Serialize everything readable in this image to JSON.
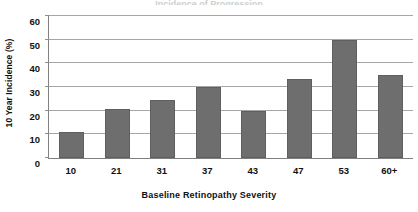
{
  "chart_data": {
    "type": "bar",
    "title": "",
    "xlabel": "Baseline Retinopathy Severity",
    "ylabel": "10 Year Incidence (%)",
    "categories": [
      "10",
      "21",
      "31",
      "37",
      "43",
      "47",
      "53",
      "60+"
    ],
    "values": [
      11,
      20.5,
      24.5,
      30,
      20,
      33.5,
      50,
      35
    ],
    "series": [
      {
        "name": "10 Year Incidence (%)",
        "values": [
          11,
          20.5,
          24.5,
          30,
          20,
          33.5,
          50,
          35
        ]
      }
    ],
    "ylim": [
      0,
      60
    ],
    "yticks": [
      0,
      10,
      20,
      30,
      40,
      50,
      60
    ],
    "ytick_labels": [
      "0",
      "10",
      "20",
      "30",
      "40",
      "50",
      "60"
    ],
    "grid": true,
    "legend": false,
    "legend_position": "none",
    "bar_color": "#6e6e6e",
    "gridline_color": "#a6a6a6",
    "axis_color": "#808080",
    "background_color": "#ffffff"
  },
  "figure": {
    "title_sliver": "Incidence of Progression",
    "y_axis_title": "10 Year Incidence (%)",
    "x_axis_title": "Baseline Retinopathy Severity"
  }
}
